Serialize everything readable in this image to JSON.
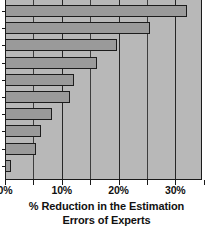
{
  "chart_data": {
    "type": "bar",
    "orientation": "horizontal",
    "title": "",
    "subtitle": "",
    "xlabel": "% Reduction in the Estimation Errors of Experts",
    "ylabel": "",
    "xlim": [
      0,
      34.7
    ],
    "ylim": [
      0,
      10
    ],
    "grid": true,
    "legend": null,
    "legend_position": "none",
    "axis_tick_labels": [
      "0%",
      "10%",
      "20%",
      "30%"
    ],
    "axis_tick_values": [
      0,
      10,
      20,
      30
    ],
    "minor_tick_values": [
      5,
      15,
      25,
      35
    ],
    "categories": [
      "",
      "",
      "",
      "",
      "",
      "",
      "",
      "",
      "",
      ""
    ],
    "values": [
      32.0,
      25.5,
      19.7,
      16.2,
      12.1,
      11.4,
      8.3,
      6.3,
      5.5,
      1.0
    ],
    "bar_color": "#9a9a9a",
    "bar_edge_color": "#1c1c1c",
    "plot_background": "#b8b8b8",
    "page_background": "#ffffff",
    "axis_color": "#1a1a1a",
    "gridline_color": "#262626"
  },
  "caption": {
    "line1": "% Reduction in the Estimation",
    "line2": "Errors of Experts"
  }
}
